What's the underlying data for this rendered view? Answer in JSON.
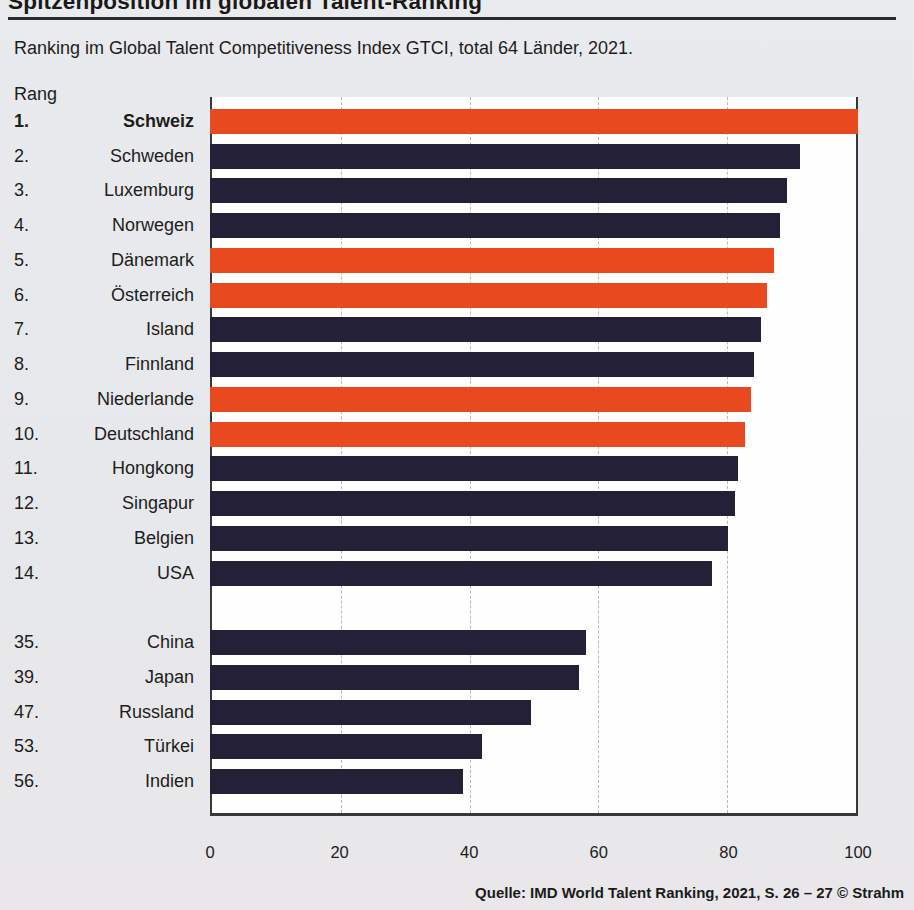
{
  "header": {
    "title": "Spitzenposition im globalen Talent-Ranking",
    "subtitle": "Ranking im Global Talent Competitiveness Index GTCI, total 64 Länder, 2021."
  },
  "chart": {
    "rang_label": "Rang"
  },
  "footer": {
    "source": "Quelle: IMD World Talent Ranking, 2021, S. 26 – 27  © Strahm"
  },
  "colors": {
    "navy": "#242038",
    "orange": "#e8491f",
    "background": "#e7e9ec",
    "plot_background": "#fefefe",
    "gridline": "#b7bac0",
    "frame": "#38383a"
  },
  "chart_data": {
    "type": "bar",
    "orientation": "horizontal",
    "title": "Spitzenposition im globalen Talent-Ranking",
    "subtitle": "Ranking im Global Talent Competitiveness Index GTCI, total 64 Länder, 2021.",
    "xlabel": "",
    "ylabel": "Rang",
    "xlim": [
      0,
      100
    ],
    "xticks": [
      0,
      20,
      40,
      60,
      80,
      100
    ],
    "grid": "dashed vertical at 20/40/60/80",
    "legend": "none",
    "highlight_note": "orange bars = Schweiz and selected European neighbours, navy = other countries",
    "rows": [
      {
        "rank": "1.",
        "country": "Schweiz",
        "value": 100,
        "color": "orange",
        "bold": true
      },
      {
        "rank": "2.",
        "country": "Schweden",
        "value": 91,
        "color": "navy"
      },
      {
        "rank": "3.",
        "country": "Luxemburg",
        "value": 89,
        "color": "navy"
      },
      {
        "rank": "4.",
        "country": "Norwegen",
        "value": 88,
        "color": "navy"
      },
      {
        "rank": "5.",
        "country": "Dänemark",
        "value": 87,
        "color": "orange"
      },
      {
        "rank": "6.",
        "country": "Österreich",
        "value": 86,
        "color": "orange"
      },
      {
        "rank": "7.",
        "country": "Island",
        "value": 85,
        "color": "navy"
      },
      {
        "rank": "8.",
        "country": "Finnland",
        "value": 84,
        "color": "navy"
      },
      {
        "rank": "9.",
        "country": "Niederlande",
        "value": 83.5,
        "color": "orange"
      },
      {
        "rank": "10.",
        "country": "Deutschland",
        "value": 82.5,
        "color": "orange"
      },
      {
        "rank": "11.",
        "country": "Hongkong",
        "value": 81.5,
        "color": "navy"
      },
      {
        "rank": "12.",
        "country": "Singapur",
        "value": 81,
        "color": "navy"
      },
      {
        "rank": "13.",
        "country": "Belgien",
        "value": 80,
        "color": "navy"
      },
      {
        "rank": "14.",
        "country": "USA",
        "value": 77.5,
        "color": "navy"
      },
      {
        "spacer": true
      },
      {
        "rank": "35.",
        "country": "China",
        "value": 58,
        "color": "navy"
      },
      {
        "rank": "39.",
        "country": "Japan",
        "value": 57,
        "color": "navy"
      },
      {
        "rank": "47.",
        "country": "Russland",
        "value": 49.5,
        "color": "navy"
      },
      {
        "rank": "53.",
        "country": "Türkei",
        "value": 42,
        "color": "navy"
      },
      {
        "rank": "56.",
        "country": "Indien",
        "value": 39,
        "color": "navy"
      }
    ]
  }
}
